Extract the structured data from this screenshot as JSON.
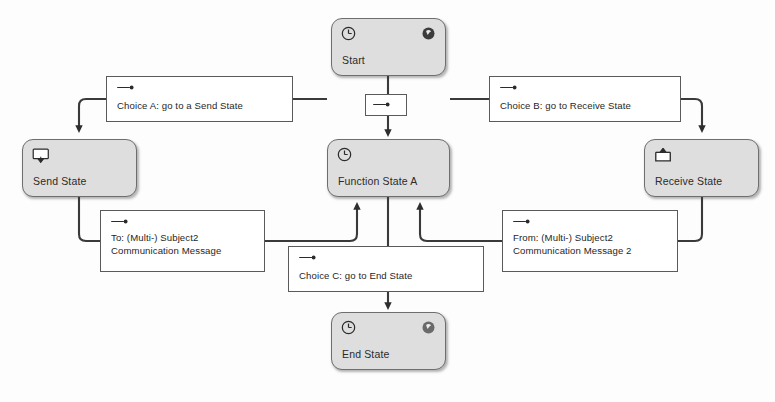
{
  "diagram": {
    "type": "state-transition-diagram",
    "canvas": {
      "width": 775,
      "height": 402
    },
    "colors": {
      "node_fill": "#dedede",
      "node_border": "#6e6e6e",
      "box_fill": "#ffffff",
      "box_border": "#5a5a5a",
      "line": "#3a3a3a",
      "text": "#1f1f1f",
      "background": "#fdfdfd"
    }
  },
  "nodes": [
    {
      "id": "start",
      "label": "Start",
      "kind": "function-state",
      "icons": [
        "clock-icon",
        "sphere-icon"
      ],
      "x": 331,
      "y": 18,
      "w": 115,
      "h": 58
    },
    {
      "id": "send_state",
      "label": "Send State",
      "kind": "send-state",
      "icons": [
        "send-icon"
      ],
      "x": 22,
      "y": 139,
      "w": 115,
      "h": 58
    },
    {
      "id": "function_state_a",
      "label": "Function State A",
      "kind": "function-state",
      "icons": [
        "clock-icon"
      ],
      "x": 327,
      "y": 139,
      "w": 123,
      "h": 58
    },
    {
      "id": "receive_state",
      "label": "Receive State",
      "kind": "receive-state",
      "icons": [
        "receive-icon"
      ],
      "x": 644,
      "y": 139,
      "w": 115,
      "h": 58
    },
    {
      "id": "end_state",
      "label": "End State",
      "kind": "function-state",
      "icons": [
        "clock-icon",
        "sphere-icon"
      ],
      "x": 331,
      "y": 312,
      "w": 115,
      "h": 58
    }
  ],
  "transitions": [
    {
      "id": "junction_start",
      "label": "",
      "icon": "arrow-right-icon",
      "lines": [],
      "x": 365,
      "y": 94,
      "w": 42,
      "h": 22,
      "from": "start",
      "to": "function_state_a"
    },
    {
      "id": "choice_a",
      "icon": "arrow-right-icon",
      "lines": [
        "Choice A: go to a Send State"
      ],
      "x": 106,
      "y": 76,
      "w": 187,
      "h": 46,
      "from": "function_state_a",
      "to": "send_state"
    },
    {
      "id": "choice_b",
      "icon": "arrow-right-icon",
      "lines": [
        "Choice B: go to Receive State"
      ],
      "x": 489,
      "y": 76,
      "w": 192,
      "h": 46,
      "from": "function_state_a",
      "to": "receive_state"
    },
    {
      "id": "message_to",
      "icon": "arrow-right-icon",
      "lines": [
        "To: (Multi-) Subject2",
        "Communication Message"
      ],
      "x": 100,
      "y": 210,
      "w": 165,
      "h": 62,
      "from": "send_state",
      "to": "function_state_a"
    },
    {
      "id": "message_from",
      "icon": "arrow-right-icon",
      "lines": [
        "From: (Multi-) Subject2",
        "Communication Message 2"
      ],
      "x": 502,
      "y": 210,
      "w": 176,
      "h": 62,
      "from": "receive_state",
      "to": "function_state_a"
    },
    {
      "id": "choice_c",
      "icon": "arrow-right-icon",
      "lines": [
        "Choice C: go to End State"
      ],
      "x": 288,
      "y": 246,
      "w": 196,
      "h": 46,
      "from": "function_state_a",
      "to": "end_state"
    }
  ]
}
